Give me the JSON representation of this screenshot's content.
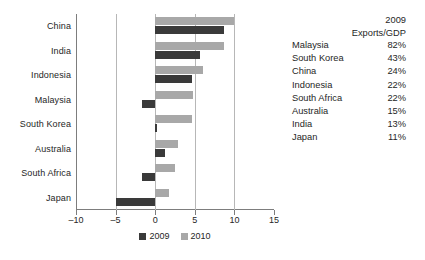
{
  "chart_data": {
    "type": "bar",
    "orientation": "horizontal",
    "title": "",
    "xlabel": "",
    "ylabel": "",
    "categories": [
      "China",
      "India",
      "Indonesia",
      "Malaysia",
      "South Korea",
      "Australia",
      "South Africa",
      "Japan"
    ],
    "series": [
      {
        "name": "2009",
        "color": "#3a3a3a",
        "values": [
          8.7,
          5.6,
          4.6,
          -1.7,
          0.2,
          1.3,
          -1.7,
          -5.0
        ]
      },
      {
        "name": "2010",
        "color": "#a8a8a8",
        "values": [
          10.0,
          8.7,
          6.0,
          4.8,
          4.6,
          2.9,
          2.5,
          1.8
        ]
      }
    ],
    "xlim": [
      -10,
      15
    ],
    "xticks": [
      -10,
      -5,
      0,
      5,
      10,
      15
    ],
    "xtick_labels": [
      "–10",
      "–5",
      "0",
      "5",
      "10",
      "15"
    ],
    "gridlines_x": [
      -5,
      0,
      5,
      10
    ],
    "grid": true,
    "legend_position": "bottom-center",
    "legend": [
      "2009",
      "2010"
    ]
  },
  "legend": {
    "items": [
      {
        "label": "2009",
        "color": "#3a3a3a",
        "swatch_name": "legend-swatch-2009"
      },
      {
        "label": "2010",
        "color": "#a8a8a8",
        "swatch_name": "legend-swatch-2010"
      }
    ]
  },
  "side_table": {
    "header_line1": "2009",
    "header_line2": "Exports/GDP",
    "rows": [
      {
        "country": "Malaysia",
        "value": "82%"
      },
      {
        "country": "South Korea",
        "value": "43%"
      },
      {
        "country": "China",
        "value": "24%"
      },
      {
        "country": "Indonesia",
        "value": "22%"
      },
      {
        "country": "South Africa",
        "value": "22%"
      },
      {
        "country": "Australia",
        "value": "15%"
      },
      {
        "country": "India",
        "value": "13%"
      },
      {
        "country": "Japan",
        "value": "11%"
      }
    ]
  }
}
